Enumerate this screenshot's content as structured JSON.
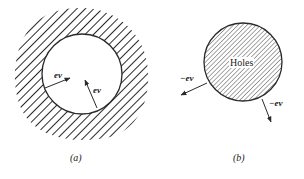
{
  "figure": {
    "panel_a": {
      "caption": "(a)",
      "arrow_labels": [
        "ev",
        "ev"
      ],
      "description": "Hatched region surrounding an empty circular hole; arrows point inward"
    },
    "panel_b": {
      "caption": "(b)",
      "region_label": "Holes",
      "arrow_labels": [
        "−ev",
        "−ev"
      ],
      "description": "Hatched circle of holes; arrows point outward"
    },
    "colors": {
      "ink": "#2a2a2a",
      "background": "#ffffff"
    }
  }
}
